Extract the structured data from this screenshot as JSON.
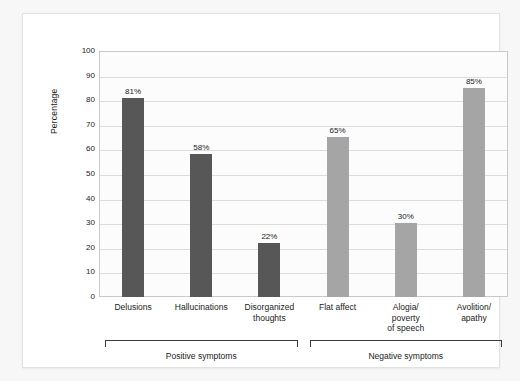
{
  "chart_data": {
    "type": "bar",
    "title": "",
    "xlabel": "",
    "ylabel": "Percentage",
    "ylim": [
      0,
      100
    ],
    "ytick_step": 10,
    "yticks": [
      "100",
      "90",
      "80",
      "70",
      "60",
      "50",
      "40",
      "30",
      "20",
      "10",
      "0"
    ],
    "grid": true,
    "legend": "none",
    "categories": [
      "Delusions",
      "Hallucinations",
      "Disorganized thoughts",
      "Flat affect",
      "Alogia/ poverty of speech",
      "Avolition/ apathy"
    ],
    "values": [
      81,
      58,
      22,
      65,
      30,
      85
    ],
    "value_labels": [
      "81%",
      "58%",
      "22%",
      "65%",
      "30%",
      "85%"
    ],
    "bars": [
      {
        "label_lines": [
          "Delusions"
        ],
        "value": 81,
        "value_label": "81%",
        "group": "Positive symptoms",
        "color": "#575757"
      },
      {
        "label_lines": [
          "Hallucinations"
        ],
        "value": 58,
        "value_label": "58%",
        "group": "Positive symptoms",
        "color": "#575757"
      },
      {
        "label_lines": [
          "Disorganized",
          "thoughts"
        ],
        "value": 22,
        "value_label": "22%",
        "group": "Positive symptoms",
        "color": "#575757"
      },
      {
        "label_lines": [
          "Flat affect"
        ],
        "value": 65,
        "value_label": "65%",
        "group": "Negative symptoms",
        "color": "#a5a5a5"
      },
      {
        "label_lines": [
          "Alogia/",
          "poverty",
          "of speech"
        ],
        "value": 30,
        "value_label": "30%",
        "group": "Negative symptoms",
        "color": "#a5a5a5"
      },
      {
        "label_lines": [
          "Avolition/",
          "apathy"
        ],
        "value": 85,
        "value_label": "85%",
        "group": "Negative symptoms",
        "color": "#a5a5a5"
      }
    ],
    "groups": [
      {
        "label": "Positive symptoms",
        "bar_start": 0,
        "bar_end": 2
      },
      {
        "label": "Negative symptoms",
        "bar_start": 3,
        "bar_end": 5
      }
    ],
    "colors": {
      "positive_bar": "#575757",
      "negative_bar": "#a5a5a5",
      "gridline": "#dcdcdc",
      "axis": "#c9c9c9",
      "text": "#1b1b1b",
      "plot_background": "#fcfcfc",
      "card_background": "#ffffff",
      "page_background": "#f7f7f7"
    }
  }
}
